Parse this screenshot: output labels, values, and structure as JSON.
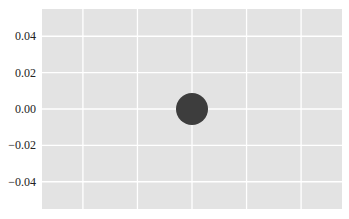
{
  "chart_data": {
    "type": "scatter",
    "title": "",
    "xlabel": "",
    "ylabel": "",
    "x": [
      0.0
    ],
    "y": [
      0.0
    ],
    "series": [
      {
        "name": "point",
        "x": [
          0.0
        ],
        "y": [
          0.0
        ],
        "color": "#3d3d3d",
        "marker_size_px": 32
      }
    ],
    "xlim": [
      -0.055,
      0.055
    ],
    "ylim": [
      -0.055,
      0.055
    ],
    "xticks": [
      -0.04,
      -0.02,
      0.0,
      0.02,
      0.04
    ],
    "xtick_labels_visible": false,
    "yticks": [
      0.04,
      0.02,
      0.0,
      -0.02,
      -0.04
    ],
    "ytick_labels": [
      "0.04",
      "0.02",
      "0.00",
      "−0.02",
      "−0.04"
    ],
    "grid": true,
    "style": "ggplot-like gray background with white grid",
    "background_color": "#e5e5e5",
    "grid_color": "#ffffff"
  }
}
